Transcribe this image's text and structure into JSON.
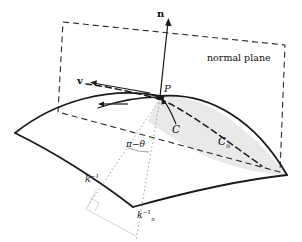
{
  "figure": {
    "background": "#ffffff",
    "stroke": "#1a1a1a",
    "shade_fill": "#e9e9e9",
    "dotted_color": "#9a9a9a",
    "faint_color": "#cccccc",
    "width": 302,
    "height": 242
  },
  "labels": {
    "normal_vector": "n",
    "tangent_vector": "v",
    "point": "P",
    "normal_plane": "normal plane",
    "curve_c": "C",
    "curve_cn_base": "C",
    "curve_cn_sub": "n",
    "angle": "π−θ",
    "radius_k_base": "k",
    "radius_k_sup": "−1",
    "radius_kn_base": "k",
    "radius_kn_sub": "n",
    "radius_kn_sup": "−1"
  },
  "geometry": {
    "point_P": [
      160,
      97
    ],
    "normal_tip": [
      168,
      20
    ],
    "surface_left_corner": [
      15,
      133
    ],
    "surface_right_corner": [
      287,
      175
    ],
    "normal_plane_corners": [
      [
        63,
        22
      ],
      [
        285,
        45
      ],
      [
        280,
        172
      ],
      [
        58,
        112
      ]
    ],
    "curvature_center_k": [
      86,
      207
    ],
    "curvature_center_kn": [
      136,
      236
    ]
  }
}
